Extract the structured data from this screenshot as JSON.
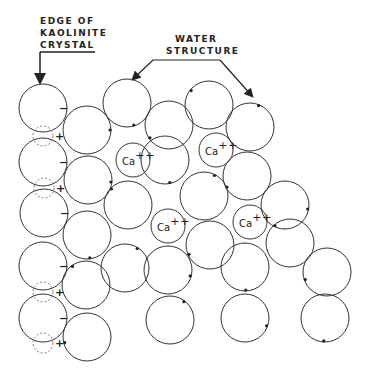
{
  "labels": {
    "edge_line1": "EDGE OF",
    "edge_line2": "KAOLINITE",
    "edge_line3": "CRYSTAL",
    "water_line1": "WATER",
    "water_line2": "STRUCTURE"
  },
  "ion": {
    "symbol": "Ca",
    "charge": "++"
  },
  "charges": {
    "negative": "−",
    "positive": "+"
  },
  "colors": {
    "stroke": "#333333",
    "dashed": "#777777",
    "background": "#ffffff"
  },
  "crystal_edge": [
    {
      "cx": 43,
      "cy": 108
    },
    {
      "cx": 43,
      "cy": 162
    },
    {
      "cx": 44,
      "cy": 213
    },
    {
      "cx": 43,
      "cy": 266
    },
    {
      "cx": 43,
      "cy": 318
    }
  ],
  "water_molecules": [
    {
      "cx": 87,
      "cy": 130
    },
    {
      "cx": 127,
      "cy": 103
    },
    {
      "cx": 169,
      "cy": 125
    },
    {
      "cx": 209,
      "cy": 105
    },
    {
      "cx": 250,
      "cy": 127
    },
    {
      "cx": 88,
      "cy": 180
    },
    {
      "cx": 165,
      "cy": 160
    },
    {
      "cx": 247,
      "cy": 176
    },
    {
      "cx": 128,
      "cy": 205
    },
    {
      "cx": 204,
      "cy": 196
    },
    {
      "cx": 285,
      "cy": 205
    },
    {
      "cx": 87,
      "cy": 235
    },
    {
      "cx": 210,
      "cy": 245
    },
    {
      "cx": 290,
      "cy": 243
    },
    {
      "cx": 125,
      "cy": 268
    },
    {
      "cx": 168,
      "cy": 270
    },
    {
      "cx": 245,
      "cy": 267
    },
    {
      "cx": 327,
      "cy": 272
    },
    {
      "cx": 86,
      "cy": 285
    },
    {
      "cx": 170,
      "cy": 320
    },
    {
      "cx": 245,
      "cy": 318
    },
    {
      "cx": 325,
      "cy": 318
    },
    {
      "cx": 87,
      "cy": 337
    }
  ],
  "calcium_ions": [
    {
      "cx": 133,
      "cy": 160
    },
    {
      "cx": 216,
      "cy": 150
    },
    {
      "cx": 168,
      "cy": 226
    },
    {
      "cx": 250,
      "cy": 222
    }
  ],
  "adsorbed_sites": [
    {
      "cx": 43,
      "cy": 136
    },
    {
      "cx": 44,
      "cy": 188
    },
    {
      "cx": 43,
      "cy": 292
    },
    {
      "cx": 43,
      "cy": 343
    }
  ]
}
